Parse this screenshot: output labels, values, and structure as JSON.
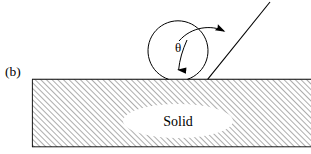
{
  "figure": {
    "panel_label": "(b)",
    "angle_symbol": "θ",
    "solid_label": "Solid",
    "colors": {
      "stroke": "#000000",
      "background": "#ffffff",
      "hatch": "#444444",
      "solid_fill": "#ffffff"
    },
    "geometry": {
      "surface_line_y": 79,
      "surface_line_x1": 32,
      "surface_line_x2": 311,
      "substrate_bottom_y": 147,
      "droplet_center_x": 178,
      "droplet_center_y": 51,
      "droplet_radius": 30,
      "contact_point_x": 208,
      "contact_point_y": 79,
      "ray_tip_x": 270,
      "ray_tip_y": 2,
      "ellipse_center_x": 178,
      "ellipse_center_y": 121,
      "ellipse_rx": 55,
      "ellipse_ry": 17
    },
    "icons": {
      "down_arrow": "down-arrow-icon",
      "curved_arrow": "curved-arrow-icon",
      "ray_line": "tangent-ray-icon"
    }
  }
}
